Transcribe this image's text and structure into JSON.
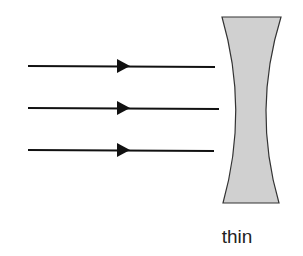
{
  "diagram": {
    "lens": {
      "type": "concave",
      "fill": "#d0d0d0",
      "stroke": "#333333",
      "caption": "thin"
    },
    "rays": [
      {
        "y": 66,
        "direction": "right"
      },
      {
        "y": 108,
        "direction": "right"
      },
      {
        "y": 150,
        "direction": "right"
      }
    ]
  }
}
